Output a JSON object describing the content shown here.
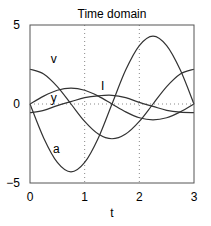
{
  "chart_data": {
    "type": "line",
    "title": "Time domain",
    "xlabel": "t",
    "ylabel": "",
    "xlim": [
      0,
      3
    ],
    "ylim": [
      -5,
      5
    ],
    "xticks": [
      "0",
      "1",
      "2",
      "3"
    ],
    "yticks": [
      "5",
      "0",
      "−5"
    ],
    "grid": {
      "vertical_dotted_at": [
        1,
        2
      ],
      "horizontal_dotted_at": [
        0
      ]
    },
    "legend": "none (inline curve labels)",
    "x": [
      0,
      0.25,
      0.5,
      0.75,
      1.0,
      1.25,
      1.5,
      1.75,
      2.0,
      2.25,
      2.5,
      2.75,
      3.0
    ],
    "series": [
      {
        "name": "v",
        "label_pos": [
          0.38,
          2.6
        ],
        "values": [
          2.2,
          1.9,
          1.1,
          0.0,
          -1.1,
          -1.9,
          -2.2,
          -1.9,
          -1.1,
          0.0,
          1.1,
          1.9,
          2.2
        ]
      },
      {
        "name": "a",
        "label_pos": [
          0.42,
          -3.1
        ],
        "values": [
          0.0,
          -2.15,
          -3.7,
          -4.3,
          -3.7,
          -2.15,
          0.0,
          2.15,
          3.7,
          4.3,
          3.7,
          2.15,
          0.0
        ]
      },
      {
        "name": "I",
        "label_pos": [
          1.3,
          0.9
        ],
        "values": [
          0.0,
          0.5,
          0.87,
          1.0,
          0.87,
          0.5,
          0.0,
          -0.5,
          -0.87,
          -1.0,
          -0.87,
          -0.5,
          0.0
        ]
      },
      {
        "name": "y",
        "label_pos": [
          0.38,
          0.15
        ],
        "values": [
          -0.55,
          -0.4,
          -0.1,
          0.15,
          0.4,
          0.52,
          0.55,
          0.4,
          0.1,
          -0.15,
          -0.4,
          -0.52,
          -0.55
        ]
      }
    ]
  },
  "labels": {
    "title": "Time domain",
    "xlabel": "t",
    "xticks": [
      "0",
      "1",
      "2",
      "3"
    ],
    "yticks": [
      "5",
      "0",
      "−5"
    ]
  },
  "colors": {
    "line": "#333333",
    "axis": "#555555",
    "grid": "#888888"
  }
}
